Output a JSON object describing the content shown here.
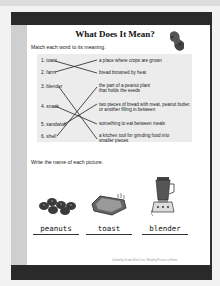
{
  "worksheet": {
    "title": "What Does It Mean?",
    "instruction_match": "Match each word to its meaning.",
    "words": [
      "1. toast",
      "2. farm",
      "3. blender",
      "4. snack",
      "5. sandwich",
      "6. shell"
    ],
    "definitions": [
      "a place where crops are grown",
      "bread browned by heat",
      "the part of a peanut plant that holds the seeds",
      "two pieces of bread with meat, peanut butter, or another filling in between",
      "something to eat between meals",
      "a kitchen tool for grinding food into smaller pieces"
    ],
    "instruction_pictures": "Write the name of each picture.",
    "pictures": [
      {
        "icon": "peanuts-icon",
        "answer": "peanuts"
      },
      {
        "icon": "toast-icon",
        "answer": "toast"
      },
      {
        "icon": "blender-icon",
        "answer": "blender"
      }
    ],
    "footer": "Guided by Grade-Word Lists / Reading Practice at Home"
  },
  "colors": {
    "frame": "#2a2a2a",
    "margin": "#cfcfcf",
    "match_box": "#ececec"
  }
}
